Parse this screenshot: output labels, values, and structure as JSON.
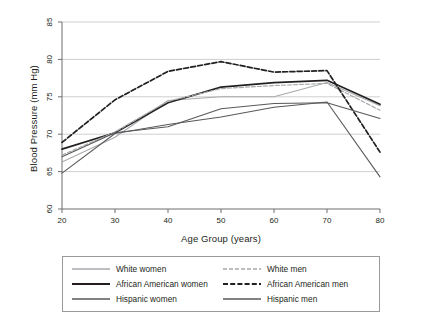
{
  "chart_data": {
    "type": "line",
    "title": "",
    "xlabel": "Age Group (years)",
    "ylabel": "Blood Pressure (mm Hg)",
    "x": [
      20,
      30,
      40,
      50,
      60,
      70,
      80
    ],
    "xticks": [
      "20",
      "30",
      "40",
      "50",
      "60",
      "70",
      "80"
    ],
    "yticks": [
      "60",
      "65",
      "70",
      "75",
      "80",
      "85"
    ],
    "xlim": [
      20,
      80
    ],
    "ylim": [
      60,
      85
    ],
    "grid": "horizontal",
    "legend_position": "below-outside",
    "series": [
      {
        "name": "White women",
        "values": [
          66.3,
          69.6,
          74.5,
          75.0,
          75.0,
          76.9,
          73.8
        ],
        "color": "#a7a9ac",
        "dash": "solid",
        "width": 1.1
      },
      {
        "name": "African American women",
        "values": [
          68.0,
          70.2,
          74.2,
          76.3,
          76.9,
          77.2,
          74.0
        ],
        "color": "#231f20",
        "dash": "solid",
        "width": 1.7
      },
      {
        "name": "Hispanic women",
        "values": [
          64.8,
          70.1,
          71.3,
          72.3,
          73.6,
          74.3,
          64.3
        ],
        "color": "#58595b",
        "dash": "solid",
        "width": 1.1
      },
      {
        "name": "White men",
        "values": [
          67.2,
          70.3,
          74.4,
          76.1,
          76.5,
          76.8,
          73.2
        ],
        "color": "#a7a9ac",
        "dash": "dashed",
        "width": 1.2
      },
      {
        "name": "African American men",
        "values": [
          68.9,
          74.6,
          78.4,
          79.7,
          78.3,
          78.5,
          67.6
        ],
        "color": "#231f20",
        "dash": "dashed",
        "width": 1.7
      },
      {
        "name": "Hispanic men",
        "values": [
          67.0,
          70.2,
          71.0,
          73.4,
          74.1,
          74.2,
          72.1
        ],
        "color": "#58595b",
        "dash": "solid",
        "width": 1.1
      }
    ]
  },
  "legend": {
    "items": [
      {
        "label": "White women",
        "series": 0
      },
      {
        "label": "White men",
        "series": 3
      },
      {
        "label": "African American women",
        "series": 1
      },
      {
        "label": "African American men",
        "series": 4
      },
      {
        "label": "Hispanic women",
        "series": 2
      },
      {
        "label": "Hispanic men",
        "series": 5
      }
    ]
  }
}
